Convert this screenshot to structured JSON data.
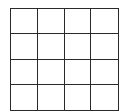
{
  "board": {
    "rows": 4,
    "cols": 4,
    "cells": [
      [
        "",
        "",
        "",
        ""
      ],
      [
        "",
        "",
        "",
        ""
      ],
      [
        "",
        "",
        "",
        ""
      ],
      [
        "",
        "",
        "",
        ""
      ]
    ],
    "line_color": "#2a2a2a",
    "background": "#ffffff"
  }
}
